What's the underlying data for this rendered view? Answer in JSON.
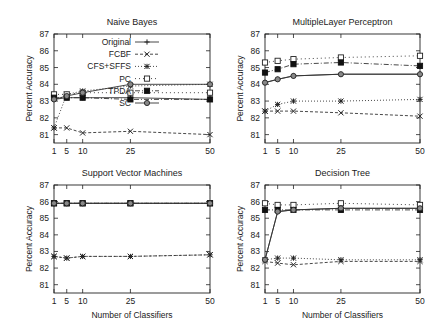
{
  "chart_data": [
    {
      "type": "line",
      "title": "Naive Bayes",
      "xlabel": "",
      "ylabel": "Percent Accuracy",
      "x": [
        1,
        5,
        10,
        25,
        50
      ],
      "xticks": [
        "1",
        "5",
        "10",
        "25",
        "50"
      ],
      "yticks": [
        "81",
        "82",
        "83",
        "84",
        "85",
        "86",
        "87"
      ],
      "xlim": [
        1,
        50
      ],
      "ylim": [
        80.5,
        87
      ],
      "legend": "top-left",
      "series": [
        {
          "name": "Original",
          "values": [
            83.1,
            83.2,
            83.2,
            83.2,
            83.1
          ]
        },
        {
          "name": "FCBF",
          "values": [
            81.4,
            81.4,
            81.1,
            81.2,
            81.0
          ]
        },
        {
          "name": "CFS+SFFS",
          "values": [
            81.4,
            83.4,
            83.6,
            83.9,
            84.0
          ]
        },
        {
          "name": "PC",
          "values": [
            83.4,
            83.4,
            83.5,
            83.5,
            83.5
          ]
        },
        {
          "name": "TPDA",
          "values": [
            83.2,
            83.2,
            83.2,
            83.1,
            83.1
          ]
        },
        {
          "name": "SC",
          "values": [
            83.1,
            83.3,
            83.5,
            84.0,
            84.0
          ]
        }
      ]
    },
    {
      "type": "line",
      "title": "MultipleLayer Perceptron",
      "xlabel": "",
      "ylabel": "Percent Accuracy",
      "x": [
        1,
        5,
        10,
        25,
        50
      ],
      "xticks": [
        "1",
        "5",
        "10",
        "25",
        "50"
      ],
      "yticks": [
        "81",
        "82",
        "83",
        "84",
        "85",
        "86",
        "87"
      ],
      "xlim": [
        1,
        50
      ],
      "ylim": [
        80.5,
        87
      ],
      "series": [
        {
          "name": "Original",
          "values": [
            84.1,
            84.3,
            84.5,
            84.6,
            84.6
          ]
        },
        {
          "name": "FCBF",
          "values": [
            82.4,
            82.4,
            82.4,
            82.3,
            82.1
          ]
        },
        {
          "name": "CFS+SFFS",
          "values": [
            82.4,
            82.8,
            83.0,
            83.0,
            83.1
          ]
        },
        {
          "name": "PC",
          "values": [
            85.3,
            85.4,
            85.5,
            85.6,
            85.7
          ]
        },
        {
          "name": "TPDA",
          "values": [
            84.7,
            84.9,
            85.2,
            85.3,
            85.1
          ]
        },
        {
          "name": "SC",
          "values": [
            84.1,
            84.3,
            84.5,
            84.6,
            84.6
          ]
        }
      ]
    },
    {
      "type": "line",
      "title": "Support Vector Machines",
      "xlabel": "Number of Classifiers",
      "ylabel": "Percent Accuracy",
      "x": [
        1,
        5,
        10,
        25,
        50
      ],
      "xticks": [
        "1",
        "5",
        "10",
        "25",
        "50"
      ],
      "yticks": [
        "81",
        "82",
        "83",
        "84",
        "85",
        "86",
        "87"
      ],
      "xlim": [
        1,
        50
      ],
      "ylim": [
        80.5,
        87
      ],
      "series": [
        {
          "name": "Original",
          "values": [
            85.9,
            85.9,
            85.9,
            85.9,
            85.9
          ]
        },
        {
          "name": "FCBF",
          "values": [
            82.7,
            82.6,
            82.7,
            82.7,
            82.8
          ]
        },
        {
          "name": "CFS+SFFS",
          "values": [
            82.7,
            82.6,
            82.7,
            82.7,
            82.8
          ]
        },
        {
          "name": "PC",
          "values": [
            85.9,
            85.9,
            85.9,
            85.9,
            85.9
          ]
        },
        {
          "name": "TPDA",
          "values": [
            85.9,
            85.9,
            85.9,
            85.9,
            85.9
          ]
        },
        {
          "name": "SC",
          "values": [
            85.9,
            85.9,
            85.9,
            85.9,
            85.9
          ]
        }
      ]
    },
    {
      "type": "line",
      "title": "Decision Tree",
      "xlabel": "Number of Classifiers",
      "ylabel": "Percent Accuracy",
      "x": [
        1,
        5,
        10,
        25,
        50
      ],
      "xticks": [
        "1",
        "5",
        "10",
        "25",
        "50"
      ],
      "yticks": [
        "81",
        "82",
        "83",
        "84",
        "85",
        "86",
        "87"
      ],
      "xlim": [
        1,
        50
      ],
      "ylim": [
        80.5,
        87
      ],
      "series": [
        {
          "name": "Original",
          "values": [
            82.5,
            85.4,
            85.5,
            85.6,
            85.6
          ]
        },
        {
          "name": "FCBF",
          "values": [
            82.4,
            82.3,
            82.2,
            82.4,
            82.4
          ]
        },
        {
          "name": "CFS+SFFS",
          "values": [
            82.5,
            82.6,
            82.6,
            82.5,
            82.5
          ]
        },
        {
          "name": "PC",
          "values": [
            85.9,
            85.8,
            85.8,
            85.9,
            85.8
          ]
        },
        {
          "name": "TPDA",
          "values": [
            85.5,
            85.5,
            85.5,
            85.5,
            85.5
          ]
        },
        {
          "name": "SC",
          "values": [
            82.5,
            85.4,
            85.5,
            85.6,
            85.6
          ]
        }
      ]
    }
  ],
  "legend_labels": [
    "Original",
    "FCBF",
    "CFS+SFFS",
    "PC",
    "TPDA",
    "SC"
  ]
}
